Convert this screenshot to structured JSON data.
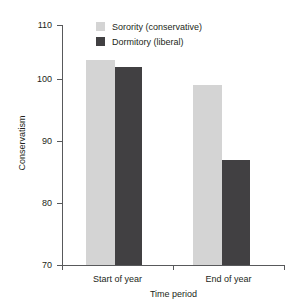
{
  "chart_data": {
    "type": "bar",
    "title": "",
    "xlabel": "Time period",
    "ylabel": "Conservatism",
    "categories": [
      "Start of year",
      "End of year"
    ],
    "series": [
      {
        "name": "Sorority (conservative)",
        "color": "#d4d4d4",
        "values": [
          103,
          99
        ]
      },
      {
        "name": "Dormitory (liberal)",
        "color": "#414042",
        "values": [
          102,
          87
        ]
      }
    ],
    "ylim": [
      70,
      110
    ],
    "yticks": [
      70,
      80,
      90,
      100,
      110
    ],
    "ytick_labels": [
      "70",
      "80",
      "90",
      "100",
      "110"
    ],
    "grid": false,
    "legend_position": "top-center"
  },
  "axes": {
    "y_title": "Conservatism",
    "x_title": "Time period",
    "y_tick_labels": [
      "110",
      "100",
      "90",
      "80",
      "70"
    ],
    "x_tick_labels": [
      "Start of year",
      "End of year"
    ]
  },
  "legend": {
    "entries": [
      {
        "label": "Sorority (conservative)",
        "color": "#d4d4d4"
      },
      {
        "label": "Dormitory (liberal)",
        "color": "#414042"
      }
    ]
  }
}
